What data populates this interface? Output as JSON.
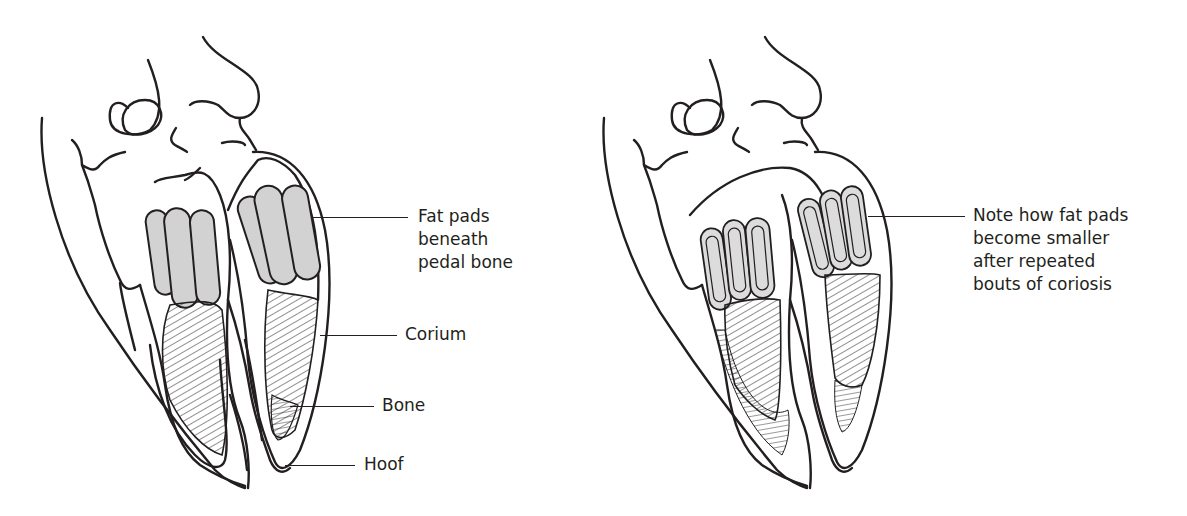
{
  "figure": {
    "left_panel": {
      "name": "normal-hoof-section",
      "labels": {
        "fat_pads": [
          "Fat pads",
          "beneath",
          "pedal bone"
        ],
        "corium": "Corium",
        "bone": "Bone",
        "hoof": "Hoof"
      }
    },
    "right_panel": {
      "name": "hoof-after-coriosis-section",
      "note": [
        "Note how fat pads",
        "become smaller",
        "after repeated",
        "bouts of coriosis"
      ]
    },
    "colors": {
      "line": "#231f20",
      "fat_pad_fill": "#d2d2d2",
      "fat_pad_fill_small": "#dcdcdc",
      "background": "#ffffff"
    }
  }
}
